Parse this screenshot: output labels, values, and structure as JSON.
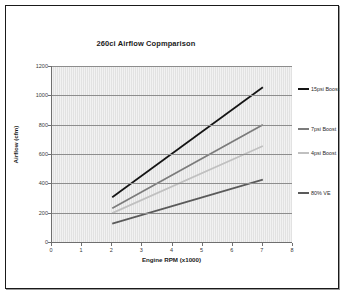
{
  "chart_data": {
    "type": "line",
    "title": "260ci Airflow Copmparison",
    "xlabel": "Engine RPM (x1000)",
    "ylabel": "Airflow (cfm)",
    "xlim": [
      0,
      8
    ],
    "ylim": [
      0,
      1200
    ],
    "xticks": [
      0,
      1,
      2,
      3,
      4,
      5,
      6,
      7,
      8
    ],
    "yticks": [
      0,
      200,
      400,
      600,
      800,
      1000,
      1200
    ],
    "grid": "horizontal",
    "legend_position": "right",
    "x": [
      2,
      7
    ],
    "series": [
      {
        "name": "15psi Boost",
        "values": [
          305,
          1055
        ],
        "color": "#141414"
      },
      {
        "name": "7psi Boost",
        "values": [
          230,
          800
        ],
        "color": "#7b7b7b"
      },
      {
        "name": "4psi Boost",
        "values": [
          197,
          655
        ],
        "color": "#c0c0c0"
      },
      {
        "name": "80% VE",
        "values": [
          125,
          425
        ],
        "color": "#5a5a5a"
      }
    ]
  },
  "axis": {
    "x_tick_labels": [
      "0",
      "1",
      "2",
      "3",
      "4",
      "5",
      "6",
      "7",
      "8"
    ],
    "y_tick_labels": [
      "0",
      "200",
      "400",
      "600",
      "800",
      "1000",
      "1200"
    ],
    "x_title": "Engine RPM (x1000)",
    "y_title": "Airflow (cfm)"
  },
  "legend": {
    "items": [
      {
        "label": "15psi Boost",
        "color": "#141414"
      },
      {
        "label": "7psi Boost",
        "color": "#7b7b7b"
      },
      {
        "label": "4psi Boost",
        "color": "#c0c0c0"
      },
      {
        "label": "80% VE",
        "color": "#5a5a5a"
      }
    ]
  },
  "colors": {
    "frame_border": "#1a1a1a",
    "plot_background": "#e2e2e2",
    "gridline": "#8d8d8d",
    "axis": "#6f6f6f",
    "text": "#1b1b1b"
  }
}
